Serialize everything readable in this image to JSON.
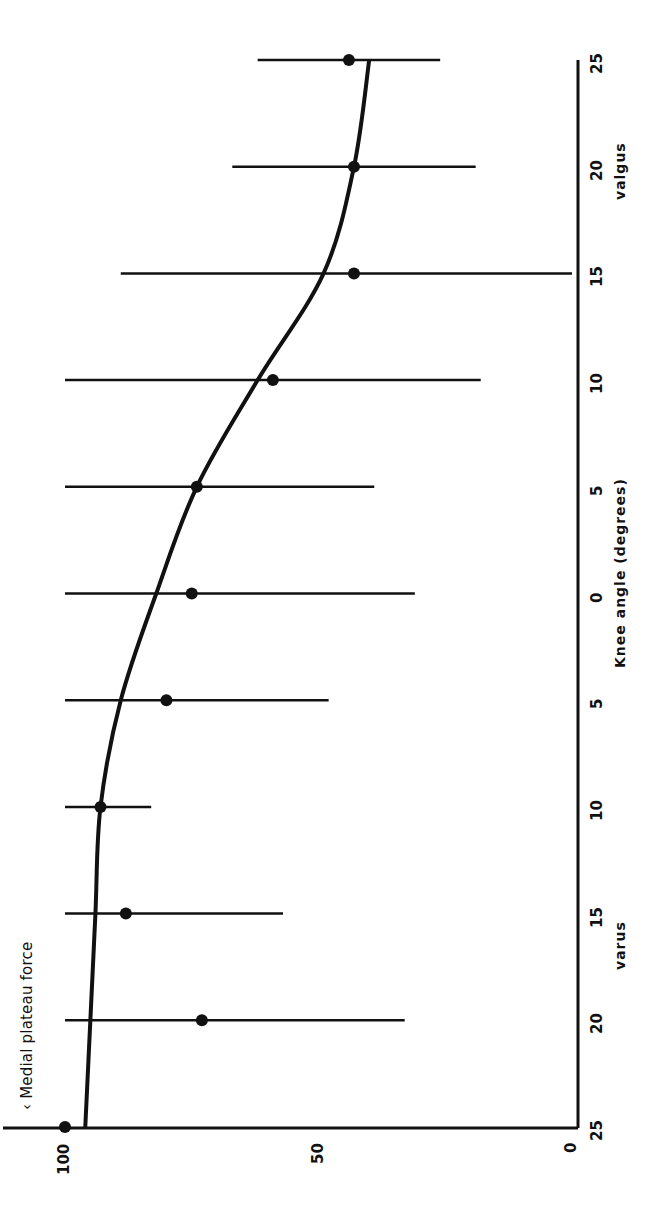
{
  "chart_data": {
    "type": "scatter",
    "orientation": "rotated-90-ccw",
    "title": "",
    "legend": "Medial plateau force",
    "legend_marker": "‹",
    "xlabel": "Knee angle (degrees)",
    "xlabel_left": "varus",
    "xlabel_right": "valgus",
    "x_tick_labels": [
      "25",
      "20",
      "15",
      "10",
      "5",
      "0",
      "5",
      "10",
      "15",
      "20",
      "25"
    ],
    "x": [
      -25,
      -20,
      -15,
      -10,
      -5,
      0,
      5,
      10,
      15,
      20,
      25
    ],
    "ylabel": "",
    "y_tick_labels": [
      "100",
      "50",
      "0"
    ],
    "y_ticks": [
      100,
      50,
      0
    ],
    "ylim": [
      0,
      100
    ],
    "xlim": [
      -25,
      25
    ],
    "grid": false,
    "series": [
      {
        "name": "Medial plateau force (mean)",
        "marker": "filled-circle",
        "values": [
          100,
          73,
          88,
          93,
          80,
          75,
          74,
          59,
          43,
          43,
          44
        ],
        "error_low": [
          null,
          33,
          57,
          83,
          48,
          31,
          39,
          18,
          0,
          19,
          26
        ],
        "error_high": [
          null,
          100,
          100,
          100,
          100,
          100,
          100,
          100,
          89,
          67,
          62
        ]
      },
      {
        "name": "Fitted curve",
        "style": "line",
        "values": [
          96,
          95,
          94,
          93,
          89,
          82,
          74,
          62,
          49,
          43,
          40
        ]
      }
    ]
  }
}
